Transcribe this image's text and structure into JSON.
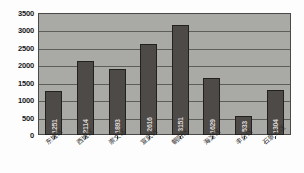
{
  "chart_data": {
    "type": "bar",
    "title": "",
    "xlabel": "",
    "ylabel": "",
    "ylim": [
      0,
      3500
    ],
    "ytick_step": 500,
    "grid": true,
    "legend": "none",
    "orientation": "vertical",
    "value_label_rotation": -90,
    "category_label_rotation": -40,
    "categories": [
      "东城区",
      "西城区",
      "崇文区",
      "宣武区",
      "朝阳区",
      "海淀区",
      "丰台区",
      "石景山区"
    ],
    "values": [
      1251,
      2114,
      1893,
      2616,
      3151,
      1629,
      533,
      1304
    ],
    "value_labels": [
      "1251",
      "2114",
      "1893",
      "2616",
      "3151",
      "1629",
      "533",
      "1304"
    ],
    "yticks": [
      "0",
      "500",
      "1000",
      "1500",
      "2000",
      "2500",
      "3000",
      "3500"
    ],
    "ytick_values": [
      0,
      500,
      1000,
      1500,
      2000,
      2500,
      3000,
      3500
    ],
    "colors": {
      "bar_fill": "#4e4a47",
      "bar_border": "#232120",
      "plot_background": "#a9a9a5",
      "gridline": "#5d5d5a",
      "axis_text": "#171717",
      "value_label": "#d8d4d0",
      "page_background": "#fdfdfd"
    }
  }
}
